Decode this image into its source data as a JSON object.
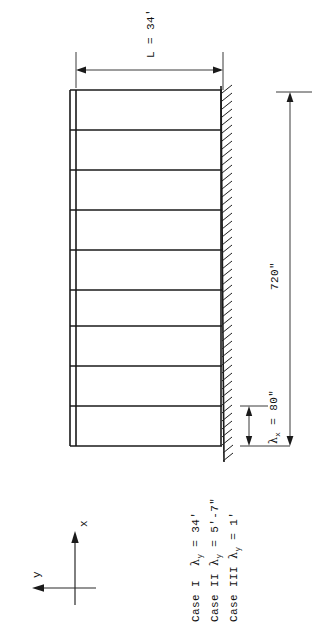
{
  "figure": {
    "kind": "engineering-elevation-drawing",
    "orientation": "rotated-90-ccw",
    "ink_color": "#1a1a1a",
    "paper_color": "#ffffff"
  },
  "dimensions": {
    "span": {
      "label": "L = 34'",
      "symbol": "L",
      "equals": "=",
      "value": "34'",
      "name": "bay-span"
    },
    "height": {
      "label": "720\"",
      "value": "720",
      "unit": "\"",
      "name": "total-frame-height"
    },
    "story": {
      "symbol": "λ",
      "subscript": "x",
      "equals": "=",
      "value": "80\"",
      "label": "λx = 80\"",
      "name": "story-height"
    }
  },
  "axes": {
    "x_label": "x",
    "y_label": "y",
    "name": "coordinate-axes"
  },
  "legend": {
    "rows": [
      {
        "case": "Case I",
        "symbol": "λ",
        "subscript": "y",
        "equals": "=",
        "value": "34'"
      },
      {
        "case": "Case II",
        "symbol": "λ",
        "subscript": "y",
        "equals": "=",
        "value": "5'-7\""
      },
      {
        "case": "Case III",
        "symbol": "λ",
        "subscript": "y",
        "equals": "=",
        "value": "1'"
      }
    ]
  },
  "frame": {
    "story_count": 9,
    "beam_count": 10,
    "column_lines": 2,
    "support": "fixed-base-hatched"
  }
}
